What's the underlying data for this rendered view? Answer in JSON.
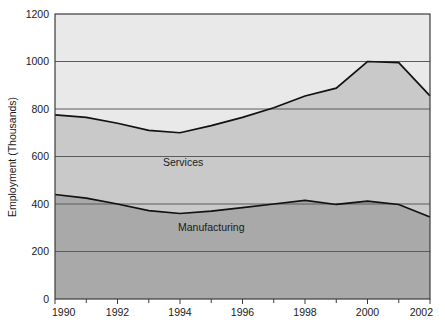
{
  "chart_data": {
    "type": "area",
    "title": "",
    "subtitle": "",
    "xlabel": "",
    "ylabel": "Employment (Thousands)",
    "xlim": [
      1990,
      2002
    ],
    "ylim": [
      0,
      1200
    ],
    "grid": true,
    "grid_axis": "y",
    "legend_position": "inline-annotations",
    "stacked": true,
    "x": [
      1990,
      1991,
      1992,
      1993,
      1994,
      1995,
      1996,
      1997,
      1998,
      1999,
      2000,
      2001,
      2002
    ],
    "xticks": [
      1990,
      1992,
      1994,
      1996,
      1998,
      2000,
      2002
    ],
    "xticklabels": [
      "1990",
      "1992",
      "1994",
      "1996",
      "1998",
      "2000",
      "2002"
    ],
    "xminorticks": [
      1991,
      1993,
      1995,
      1997,
      1999,
      2001
    ],
    "yticks": [
      0,
      200,
      400,
      600,
      800,
      1000,
      1200
    ],
    "yticklabels": [
      "0",
      "200",
      "400",
      "600",
      "800",
      "1000",
      "1200"
    ],
    "series": [
      {
        "name": "Manufacturing",
        "label": "Manufacturing",
        "color": "#a9a9a9",
        "values": [
          440,
          425,
          400,
          372,
          360,
          370,
          385,
          400,
          415,
          398,
          412,
          398,
          345
        ]
      },
      {
        "name": "Services",
        "label": "Services",
        "color": "#c9c9c9",
        "values": [
          775,
          765,
          740,
          710,
          700,
          730,
          765,
          805,
          855,
          888,
          1000,
          995,
          855
        ]
      }
    ],
    "annotations": [
      {
        "text": "Services",
        "x": 1994.1,
        "y": 560
      },
      {
        "text": "Manufacturing",
        "x": 1995.0,
        "y": 285
      }
    ]
  },
  "style": {
    "background_color": "#ffffff",
    "plot_background_color": "#e9e9e9",
    "band_services_color": "#c9c9c9",
    "band_manufacturing_color": "#a9a9a9",
    "gridline_color": "#5a5a5a",
    "axis_color": "#3c3c3c",
    "line_color": "#111111",
    "text_color": "#1a1a1a"
  }
}
